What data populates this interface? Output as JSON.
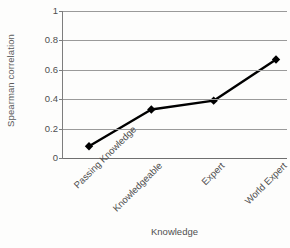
{
  "chart_data": {
    "type": "line",
    "title": "",
    "xlabel": "Knowledge",
    "ylabel": "Spearman correlation",
    "categories": [
      "Passing Knowledge",
      "Knowledgeable",
      "Expert",
      "World Expert"
    ],
    "values": [
      0.08,
      0.33,
      0.39,
      0.67
    ],
    "ylim": [
      0,
      1
    ],
    "yticks": [
      0,
      0.2,
      0.4,
      0.6,
      0.8,
      1
    ],
    "ytick_labels": [
      "0",
      "0.2",
      "0.4",
      "0.6",
      "0.8",
      "1"
    ],
    "grid": "horizontal",
    "legend": "none",
    "marker": "diamond",
    "series_color": "#000000",
    "gridline_color": "#9a9a9a",
    "axis_color": "#7d7d7d",
    "background_color": "#fdfdfc"
  },
  "axes": {
    "y_title": "Spearman correlation",
    "x_title": "Knowledge"
  }
}
